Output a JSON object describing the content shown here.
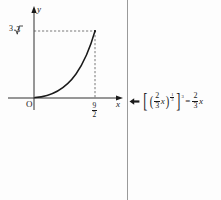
{
  "figure": {
    "kind": "cartesian-graph-with-annotation",
    "background_color": "#fdfdfd",
    "ink_color": "#1a1a1a",
    "divider_color": "#9a9a9a"
  },
  "graph": {
    "axes": {
      "x_label": "x",
      "y_label": "y",
      "origin_label": "O",
      "x_arrow": "arrowhead-right",
      "y_arrow": "arrowhead-up"
    },
    "ticks": {
      "y": [
        {
          "label_parts": {
            "coefficient": "3",
            "radical": "√",
            "radicand": "3"
          },
          "label_text": "3√3",
          "value": 5.196
        }
      ],
      "x": [
        {
          "label_numerator": "9",
          "label_denominator": "2",
          "label_text": "9/2",
          "value": 4.5
        }
      ]
    },
    "curve": {
      "description": "concave-up increasing curve from origin to endpoint",
      "style": "solid",
      "endpoint": {
        "x": 4.5,
        "y": 5.196
      },
      "start": {
        "x": 0,
        "y": 0
      }
    },
    "guides": [
      {
        "orientation": "horizontal",
        "style": "dashed",
        "from": "y-axis",
        "to": "curve-endpoint"
      },
      {
        "orientation": "vertical",
        "style": "dashed",
        "from": "x-axis",
        "to": "curve-endpoint"
      }
    ]
  },
  "annotation": {
    "marker": "left-arrow-icon",
    "formula_text": "[ ( (2/3) x )^(1/3) ]^3 = (2/3) x",
    "lhs": {
      "outer_bracket_open": "[",
      "outer_bracket_close": "]",
      "paren_open": "(",
      "paren_close": ")",
      "base_fraction": {
        "numerator": "2",
        "denominator": "3"
      },
      "variable": "x",
      "inner_exponent": {
        "numerator": "1",
        "denominator": "3"
      },
      "outer_exponent": "3"
    },
    "equals": "=",
    "rhs": {
      "fraction": {
        "numerator": "2",
        "denominator": "3"
      },
      "variable": "x"
    }
  }
}
